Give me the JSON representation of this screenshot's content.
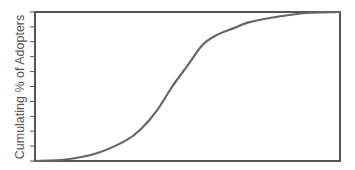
{
  "chart_data": {
    "type": "line",
    "title": "",
    "xlabel": "",
    "ylabel": "Cumulating % of Adopters",
    "ylim": [
      0,
      100
    ],
    "xlim": [
      0,
      100
    ],
    "y_ticks": [
      0,
      10,
      20,
      30,
      40,
      50,
      60,
      70,
      80,
      90,
      100
    ],
    "y_tick_labels": [],
    "x_tick_labels": [],
    "grid": false,
    "legend": null,
    "series": [
      {
        "name": "Cumulative adoption (S-curve)",
        "color": "#666666",
        "x": [
          0,
          10,
          20,
          30,
          35,
          40,
          45,
          50,
          55,
          60,
          65,
          70,
          80,
          90,
          100
        ],
        "y": [
          0,
          1,
          5,
          14,
          22,
          34,
          50,
          64,
          78,
          85,
          89,
          93,
          97,
          99.5,
          100
        ]
      }
    ]
  },
  "colors": {
    "axis": "#555555",
    "line": "#666666",
    "label": "#555555"
  }
}
